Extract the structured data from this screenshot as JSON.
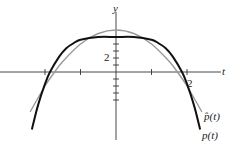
{
  "chart_data": {
    "type": "line",
    "title": "",
    "xlabel": "t",
    "ylabel": "y",
    "xlim": [
      -3.25,
      3.1
    ],
    "ylim": [
      -10.9,
      10.3
    ],
    "grid": false,
    "legend_position": "inline-right",
    "x_ticks": [
      -2,
      -1,
      1,
      2
    ],
    "x_tick_labels": [
      {
        "value": 2,
        "label": "2"
      }
    ],
    "y_ticks": [
      -4,
      -3,
      -2,
      -1,
      1,
      2,
      3,
      4
    ],
    "y_tick_labels": [
      {
        "value": 2,
        "label": "2"
      }
    ],
    "series": [
      {
        "name": "p(t)",
        "color": "#111111",
        "stroke_width": 2,
        "x": [
          -2.37,
          -2.2,
          -2.0,
          -1.86,
          -1.6,
          -1.4,
          -1.2,
          -1.0,
          -0.5,
          0,
          0.5,
          1.0,
          1.2,
          1.4,
          1.6,
          1.86,
          2.0,
          2.2,
          2.37
        ],
        "values": [
          -8.2,
          -4.8,
          -1.7,
          0.0,
          2.2,
          3.4,
          4.1,
          4.6,
          5.0,
          5.0,
          5.0,
          4.6,
          4.1,
          3.4,
          2.2,
          0.0,
          -1.7,
          -4.8,
          -8.2
        ]
      },
      {
        "name": "p̂(t)",
        "color": "#999999",
        "stroke_width": 1.4,
        "x": [
          -2.42,
          -2.0,
          -1.73,
          -1.5,
          -1.0,
          -0.5,
          0,
          0.5,
          1.0,
          1.5,
          1.73,
          2.0,
          2.42
        ],
        "values": [
          -5.7,
          -2.0,
          0.0,
          1.5,
          4.0,
          5.5,
          6.0,
          5.5,
          4.0,
          1.5,
          0.0,
          -2.0,
          -5.7
        ]
      }
    ],
    "annotations": [
      {
        "text": "y",
        "position": "top of y-axis"
      },
      {
        "text": "t",
        "position": "right end of t-axis"
      },
      {
        "text": "p̂(t)",
        "position": "end of gray curve"
      },
      {
        "text": "p(t)",
        "position": "end of black curve"
      }
    ]
  },
  "labels": {
    "y_axis": "y",
    "t_axis": "t",
    "y_tick_2": "2",
    "x_tick_2": "2",
    "phat": "p̂(t)",
    "p": "p(t)"
  }
}
